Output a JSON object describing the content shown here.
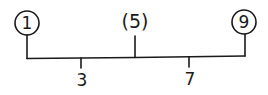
{
  "diagram": {
    "type": "tree",
    "colors": {
      "ink": "#1a1a1a",
      "background": "#ffffff"
    },
    "top_nodes": [
      {
        "label": "1",
        "style": "circled"
      },
      {
        "label": "(5)",
        "style": "parenthesized"
      },
      {
        "label": "9",
        "style": "circled"
      }
    ],
    "bottom_nodes": [
      {
        "label": "3"
      },
      {
        "label": "7"
      }
    ]
  }
}
